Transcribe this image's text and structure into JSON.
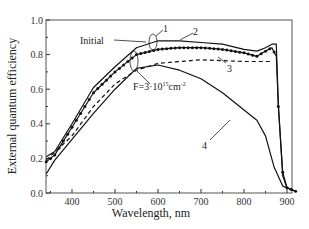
{
  "chart_data": {
    "type": "line",
    "title": "",
    "xlabel": "Wavelength, nm",
    "ylabel": "External quantum efficiency",
    "xlim": [
      340,
      925
    ],
    "ylim": [
      0.0,
      1.0
    ],
    "x_ticks": [
      400,
      500,
      600,
      700,
      800,
      900
    ],
    "y_ticks": [
      "0.0",
      "0.2",
      "0.4",
      "0.6",
      "0.8",
      "1.0"
    ],
    "grid": false,
    "legend": "none (inline numeric labels)",
    "annotations": [
      "Initial",
      "F=3·10^15 cm^-2",
      "1",
      "2",
      "3",
      "4"
    ],
    "series": [
      {
        "name": "1",
        "label": "Initial",
        "style": "solid",
        "x": [
          340,
          360,
          400,
          450,
          500,
          550,
          600,
          650,
          700,
          750,
          800,
          830,
          850,
          865,
          875,
          880,
          890,
          900,
          920
        ],
        "y": [
          0.21,
          0.24,
          0.4,
          0.61,
          0.73,
          0.84,
          0.88,
          0.88,
          0.87,
          0.86,
          0.83,
          0.82,
          0.84,
          0.86,
          0.86,
          0.5,
          0.1,
          0.03,
          0.01
        ]
      },
      {
        "name": "2",
        "style": "solid with markers",
        "x": [
          340,
          360,
          400,
          450,
          500,
          550,
          600,
          650,
          700,
          750,
          800,
          830,
          850,
          865,
          875,
          880,
          890,
          900,
          920
        ],
        "y": [
          0.18,
          0.22,
          0.38,
          0.58,
          0.7,
          0.8,
          0.83,
          0.84,
          0.84,
          0.83,
          0.81,
          0.79,
          0.82,
          0.84,
          0.79,
          0.5,
          0.12,
          0.03,
          0.01
        ]
      },
      {
        "name": "3",
        "style": "dashed",
        "x": [
          340,
          400,
          450,
          500,
          550,
          600,
          700,
          800,
          860
        ],
        "y": [
          0.19,
          0.33,
          0.5,
          0.63,
          0.71,
          0.75,
          0.77,
          0.76,
          0.76
        ]
      },
      {
        "name": "4",
        "label": "F=3·10^15 cm^-2",
        "style": "solid",
        "x": [
          340,
          360,
          400,
          450,
          500,
          550,
          600,
          650,
          700,
          750,
          800,
          830,
          850,
          870,
          890,
          920
        ],
        "y": [
          0.11,
          0.19,
          0.31,
          0.46,
          0.6,
          0.72,
          0.74,
          0.71,
          0.66,
          0.58,
          0.48,
          0.42,
          0.33,
          0.15,
          0.04,
          0.01
        ]
      }
    ]
  },
  "labels": {
    "xlabel": "Wavelength, nm",
    "ylabel": "External quantum efficiency",
    "initial": "Initial",
    "fluence_prefix": "F=3·10",
    "fluence_exp": "15",
    "fluence_unit": "cm",
    "fluence_unit_exp": "-2",
    "c1": "1",
    "c2": "2",
    "c3": "3",
    "c4": "4"
  }
}
